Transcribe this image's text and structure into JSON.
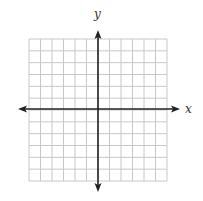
{
  "diagram": {
    "type": "coordinate-plane",
    "grid": {
      "columns": 12,
      "rows": 12,
      "left": 29,
      "top": 39,
      "right": 167,
      "bottom": 181,
      "line_color": "#c8c8c8"
    },
    "axes": {
      "origin_x": 98,
      "origin_y": 109,
      "color": "#222222",
      "x_label": "x",
      "y_label": "y",
      "x_extent": [
        18,
        180
      ],
      "y_extent": [
        30,
        192
      ]
    }
  }
}
